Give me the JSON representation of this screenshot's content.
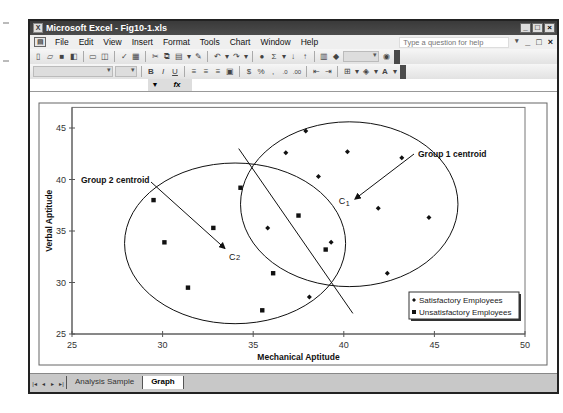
{
  "window": {
    "title": "Microsoft Excel - Fig10-1.xls",
    "controls": [
      "_",
      "□",
      "×"
    ]
  },
  "menubar": {
    "items": [
      "File",
      "Edit",
      "View",
      "Insert",
      "Format",
      "Tools",
      "Chart",
      "Window",
      "Help"
    ],
    "help_placeholder": "Type a question for help",
    "doc_controls": [
      "▾",
      "_",
      "□",
      "×"
    ]
  },
  "toolbar_standard": {
    "icons": [
      "new-icon",
      "open-icon",
      "save-icon",
      "permission-icon",
      "print-icon",
      "print-preview-icon",
      "spelling-icon",
      "research-icon",
      "cut-icon",
      "copy-icon",
      "paste-icon",
      "format-painter-icon",
      "undo-icon",
      "redo-icon",
      "hyperlink-icon",
      "autosum-icon",
      "sort-ascending-icon",
      "sort-descending-icon",
      "chart-wizard-icon",
      "drawing-icon",
      "zoom-combo",
      "help-icon"
    ]
  },
  "toolbar_formatting": {
    "icons": [
      "font-combo",
      "size-combo",
      "bold-icon",
      "italic-icon",
      "underline-icon",
      "align-left-icon",
      "center-icon",
      "align-right-icon",
      "merge-center-icon",
      "currency-icon",
      "percent-icon",
      "comma-icon",
      "increase-decimal-icon",
      "decrease-decimal-icon",
      "decrease-indent-icon",
      "increase-indent-icon",
      "borders-icon",
      "fill-color-icon",
      "font-color-icon"
    ],
    "glyphs": {
      "bold": "B",
      "italic": "I",
      "underline": "U",
      "currency": "$",
      "percent": "%"
    }
  },
  "formula_bar": {
    "fx_label": "fx",
    "name_box": "",
    "formula": ""
  },
  "sheet_tabs": {
    "nav": [
      "|◂",
      "◂",
      "▸",
      "▸|"
    ],
    "tabs": [
      {
        "label": "Analysis Sample",
        "active": false
      },
      {
        "label": "Graph",
        "active": true
      }
    ]
  },
  "chart_data": {
    "type": "scatter",
    "title": "",
    "xlabel": "Mechanical Aptitude",
    "ylabel": "Verbal Aptitude",
    "xlim": [
      25,
      50
    ],
    "ylim": [
      25,
      47
    ],
    "x_ticks": [
      25,
      30,
      35,
      40,
      45,
      50
    ],
    "y_ticks": [
      25,
      30,
      35,
      40,
      45
    ],
    "grid": false,
    "legend_position": "lower-right",
    "series": [
      {
        "name": "Satisfactory Employees",
        "marker": "diamond",
        "points": [
          [
            37.9,
            44.7
          ],
          [
            36.8,
            42.6
          ],
          [
            40.2,
            42.7
          ],
          [
            43.2,
            42.1
          ],
          [
            38.6,
            40.3
          ],
          [
            41.9,
            37.2
          ],
          [
            44.7,
            36.3
          ],
          [
            35.8,
            35.3
          ],
          [
            39.3,
            33.9
          ],
          [
            42.4,
            30.9
          ],
          [
            38.1,
            28.6
          ]
        ]
      },
      {
        "name": "Unsatisfactory Employees",
        "marker": "square",
        "points": [
          [
            29.5,
            38.0
          ],
          [
            30.1,
            33.9
          ],
          [
            31.4,
            29.5
          ],
          [
            32.8,
            35.3
          ],
          [
            34.3,
            39.2
          ],
          [
            37.5,
            36.5
          ],
          [
            36.1,
            30.9
          ],
          [
            35.5,
            27.3
          ],
          [
            39.0,
            33.2
          ]
        ]
      }
    ],
    "annotations": [
      {
        "text": "Group 1 centroid",
        "label": "C",
        "subscript": "1",
        "centroid": [
          40.5,
          38.0
        ]
      },
      {
        "text": "Group 2 centroid",
        "label": "C",
        "subscript": "2",
        "centroid": [
          33.5,
          33.2
        ]
      }
    ],
    "ellipses": [
      {
        "group": 1,
        "center": [
          40.3,
          37.6
        ],
        "rx": 6.0,
        "ry": 8.0
      },
      {
        "group": 2,
        "center": [
          34.0,
          33.8
        ],
        "rx": 6.1,
        "ry": 7.8
      }
    ],
    "separator_line": {
      "from": [
        34.2,
        43.0
      ],
      "to": [
        40.5,
        27.0
      ]
    }
  },
  "colors": {
    "titlebar": "#3f3f3f",
    "toolbar": "#e8e8e8",
    "tabbar": "#c8c8c8",
    "plot_ink": "#111111"
  }
}
